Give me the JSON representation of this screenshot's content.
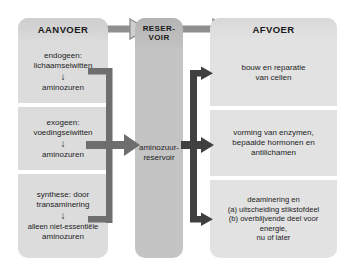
{
  "diagram": {
    "columns": {
      "left": {
        "header": "AANVOER",
        "cells": [
          {
            "line1": "endogeen:",
            "line2": "lichaamseiwitten",
            "arrow": "↓",
            "line3": "aminozuren"
          },
          {
            "line1": "exogeen:",
            "line2": "voedingseiwitten",
            "arrow": "↓",
            "line3": "aminozuren"
          },
          {
            "line1": "synthese: door",
            "line2": "transaminering",
            "arrow": "↓",
            "line3": "alleen niet-essentiële",
            "line4": "aminozuren"
          }
        ]
      },
      "middle": {
        "header_line1": "RESER-",
        "header_line2": "VOIR",
        "body_line1": "aminozuur-",
        "body_line2": "reservoir"
      },
      "right": {
        "header": "AFVOER",
        "cells": [
          {
            "line1": "bouw en reparatie",
            "line2": "van cellen"
          },
          {
            "line1": "vorming van enzymen,",
            "line2": "bepaalde hormonen en",
            "line3": "antilichamen"
          },
          {
            "line1": "deaminering en",
            "line2": "(a) uitscheiding stikstofdeel",
            "line3": "(b) overblijvende deel voor energie,",
            "line4": "nu of later"
          }
        ]
      }
    },
    "connectors": {
      "top_left_label": "aanvoer naar reservoir",
      "top_right_label": "reservoir naar afvoer",
      "left_trunk_label": "samenvoeging van aanvoerbronnen",
      "right_trunk_label": "verdeling naar afvoerbestemmingen"
    },
    "colors": {
      "panel_left": "#d9d9d9",
      "panel_middle": "#c4c4c4",
      "panel_right": "#e2e2e2",
      "arrow_dark": "#595959",
      "arrow_outline": "#8c8c8c",
      "text": "#1d1d1d",
      "background": "#ffffff"
    }
  }
}
